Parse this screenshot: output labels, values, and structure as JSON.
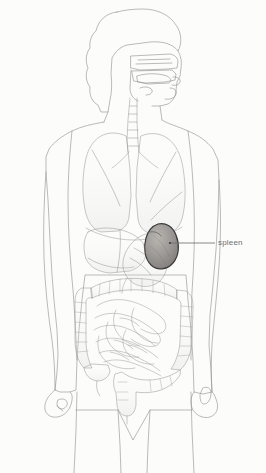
{
  "figure": {
    "background_color": "#fcfcfb",
    "outline_color": "#8a8a8c",
    "organ_line_color": "#9a9a9c",
    "width": 266,
    "height": 473
  },
  "annotations": [
    {
      "id": "spleen",
      "label": "spleen",
      "text_color": "#6e6e70",
      "leader_line": {
        "color": "#6a6a6c",
        "x1": 170,
        "y1": 243,
        "x2": 215,
        "y2": 243
      },
      "target_point": {
        "x": 170,
        "y": 243
      }
    }
  ],
  "organs": [
    {
      "id": "head",
      "name": "head-outline",
      "highlighted": false
    },
    {
      "id": "nasal-cavity",
      "name": "nasal-and-oral-cavity",
      "highlighted": false
    },
    {
      "id": "trachea",
      "name": "trachea",
      "highlighted": false
    },
    {
      "id": "lung-left",
      "name": "left-lung",
      "highlighted": false
    },
    {
      "id": "lung-right",
      "name": "right-lung",
      "highlighted": false
    },
    {
      "id": "liver",
      "name": "liver",
      "highlighted": false
    },
    {
      "id": "stomach",
      "name": "stomach",
      "highlighted": false
    },
    {
      "id": "spleen",
      "name": "spleen",
      "highlighted": true,
      "fill": "#9e9a97",
      "stroke": "#3a3a3c"
    },
    {
      "id": "large-intestine",
      "name": "large-intestine",
      "highlighted": false
    },
    {
      "id": "small-intestine",
      "name": "small-intestine",
      "highlighted": false
    },
    {
      "id": "rectum",
      "name": "rectum",
      "highlighted": false
    }
  ],
  "body": {
    "parts": [
      {
        "id": "torso",
        "name": "torso-outline"
      },
      {
        "id": "arm-left",
        "name": "left-arm-outline"
      },
      {
        "id": "arm-right",
        "name": "right-arm-outline"
      },
      {
        "id": "hand-left",
        "name": "left-hand-outline"
      },
      {
        "id": "hand-right",
        "name": "right-hand-outline"
      },
      {
        "id": "legs",
        "name": "legs-outline"
      }
    ]
  }
}
